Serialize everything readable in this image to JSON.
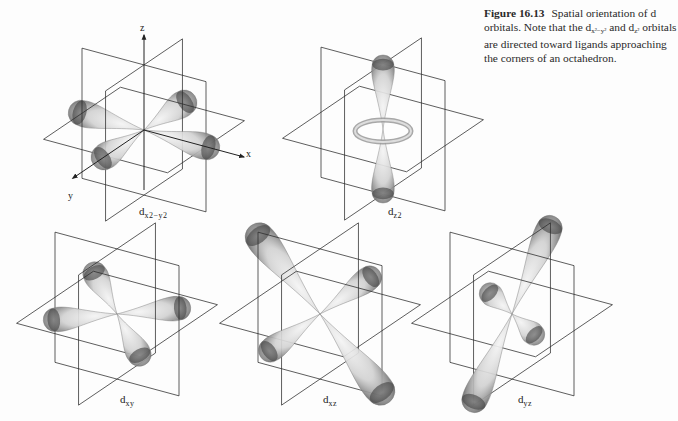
{
  "caption": {
    "figure_number": "Figure 16.13",
    "text_1": "Spatial orientation of d orbitals. Note that the d",
    "sub_1": "x²−y²",
    "text_2": " and d",
    "sub_2": "z²",
    "text_3": " orbitals are directed toward ligands approaching the corners of an octahedron."
  },
  "axes_labels": {
    "x": "x",
    "y": "y",
    "z": "z"
  },
  "orbitals": [
    {
      "id": "dx2-y2",
      "prefix": "d",
      "subscript": "x2−y2"
    },
    {
      "id": "dz2",
      "prefix": "d",
      "subscript": "z2"
    },
    {
      "id": "dxy",
      "prefix": "d",
      "subscript": "xy"
    },
    {
      "id": "dxz",
      "prefix": "d",
      "subscript": "xz"
    },
    {
      "id": "dyz",
      "prefix": "d",
      "subscript": "yz"
    }
  ],
  "colors": {
    "line": "#2b2b2b",
    "lobe_dark": "#555555",
    "lobe_light": "#f2f2f2",
    "background": "#fdfdfd"
  }
}
